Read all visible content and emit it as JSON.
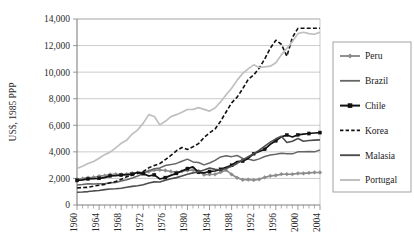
{
  "chart_data": {
    "type": "line",
    "title": "",
    "xlabel": "",
    "ylabel": "US$, 1985 PPP",
    "xlim": [
      1960,
      2004
    ],
    "ylim": [
      0,
      14000
    ],
    "ytick_labels": [
      "0",
      "2,000",
      "4,000",
      "6,000",
      "8,000",
      "10,000",
      "12,000",
      "14,000"
    ],
    "ytick_values": [
      0,
      2000,
      4000,
      6000,
      8000,
      10000,
      12000,
      14000
    ],
    "xtick_labels": [
      "1960",
      "1964",
      "1968",
      "1972",
      "1976",
      "1980",
      "1984",
      "1988",
      "1992",
      "1996",
      "2000",
      "2004"
    ],
    "xtick_values": [
      1960,
      1964,
      1968,
      1972,
      1976,
      1980,
      1984,
      1988,
      1992,
      1996,
      2000,
      2004
    ],
    "grid": true,
    "minor_xticks": true,
    "legend_position": "right",
    "x": [
      1960,
      1961,
      1962,
      1963,
      1964,
      1965,
      1966,
      1967,
      1968,
      1969,
      1970,
      1971,
      1972,
      1973,
      1974,
      1975,
      1976,
      1977,
      1978,
      1979,
      1980,
      1981,
      1982,
      1983,
      1984,
      1985,
      1986,
      1987,
      1988,
      1989,
      1990,
      1991,
      1992,
      1993,
      1994,
      1995,
      1996,
      1997,
      1998,
      1999,
      2000,
      2001,
      2002,
      2003,
      2004
    ],
    "series": [
      {
        "name": "Peru",
        "color": "#8c8c8c",
        "style": "solid-marker",
        "marker": "diamond",
        "width": 1.6,
        "values": [
          1950,
          1990,
          2060,
          2090,
          2170,
          2210,
          2300,
          2320,
          2300,
          2330,
          2400,
          2430,
          2450,
          2520,
          2620,
          2640,
          2600,
          2520,
          2460,
          2540,
          2600,
          2640,
          2560,
          2280,
          2300,
          2310,
          2470,
          2620,
          2300,
          2050,
          1900,
          1910,
          1880,
          1930,
          2080,
          2190,
          2230,
          2320,
          2320,
          2320,
          2380,
          2380,
          2420,
          2450,
          2450
        ]
      },
      {
        "name": "Brazil",
        "color": "#666666",
        "style": "solid",
        "marker": "none",
        "width": 1.5,
        "values": [
          1500,
          1540,
          1600,
          1580,
          1600,
          1600,
          1670,
          1700,
          1800,
          1900,
          2030,
          2180,
          2370,
          2590,
          2730,
          2790,
          2970,
          3040,
          3130,
          3290,
          3450,
          3240,
          3200,
          3020,
          3160,
          3360,
          3620,
          3700,
          3640,
          3730,
          3500,
          3460,
          3350,
          3470,
          3650,
          3770,
          3820,
          3890,
          3860,
          3850,
          4000,
          4000,
          4030,
          4000,
          4150
        ]
      },
      {
        "name": "Chile",
        "color": "#111111",
        "style": "solid-marker",
        "marker": "square",
        "width": 1.7,
        "values": [
          1850,
          1890,
          1960,
          1980,
          2010,
          2060,
          2190,
          2210,
          2250,
          2290,
          2310,
          2460,
          2360,
          2180,
          2270,
          1960,
          2060,
          2230,
          2380,
          2560,
          2740,
          2870,
          2460,
          2420,
          2520,
          2560,
          2680,
          2830,
          2990,
          3270,
          3300,
          3510,
          3860,
          4030,
          4200,
          4570,
          4830,
          5130,
          5270,
          5120,
          5280,
          5340,
          5380,
          5420,
          5450
        ]
      },
      {
        "name": "Korea",
        "color": "#111111",
        "style": "dashed",
        "marker": "none",
        "width": 1.6,
        "values": [
          1280,
          1320,
          1330,
          1420,
          1490,
          1550,
          1680,
          1770,
          1930,
          2130,
          2250,
          2400,
          2510,
          2800,
          2980,
          3120,
          3420,
          3730,
          4080,
          4330,
          4180,
          4380,
          4620,
          5080,
          5430,
          5720,
          6310,
          7000,
          7690,
          8120,
          8750,
          9450,
          9790,
          10300,
          11000,
          11800,
          12400,
          12100,
          11200,
          12600,
          13300,
          13300,
          13300,
          13300,
          13300
        ]
      },
      {
        "name": "Malasia",
        "color": "#4d4d4d",
        "style": "solid",
        "marker": "none",
        "width": 1.6,
        "values": [
          960,
          980,
          1010,
          1060,
          1090,
          1160,
          1200,
          1220,
          1260,
          1330,
          1400,
          1450,
          1530,
          1660,
          1740,
          1730,
          1870,
          1970,
          2060,
          2190,
          2320,
          2420,
          2510,
          2630,
          2780,
          2680,
          2630,
          2740,
          2920,
          3130,
          3390,
          3630,
          3860,
          4130,
          4430,
          4730,
          4980,
          5170,
          4700,
          4800,
          5000,
          4800,
          4850,
          4880,
          4900
        ]
      },
      {
        "name": "Portugal",
        "color": "#bfbfbf",
        "style": "solid",
        "marker": "none",
        "width": 1.7,
        "values": [
          2750,
          2920,
          3120,
          3280,
          3520,
          3790,
          3980,
          4300,
          4640,
          4880,
          5340,
          5660,
          6160,
          6800,
          6660,
          6030,
          6300,
          6650,
          6800,
          6980,
          7190,
          7200,
          7330,
          7200,
          7070,
          7300,
          7760,
          8300,
          8790,
          9400,
          9900,
          10250,
          10550,
          10350,
          10400,
          10450,
          10700,
          11300,
          11800,
          12300,
          12900,
          13000,
          12900,
          12850,
          13000
        ]
      }
    ]
  },
  "legend": {
    "items": [
      {
        "label": "Peru"
      },
      {
        "label": "Brazil"
      },
      {
        "label": "Chile"
      },
      {
        "label": "Korea"
      },
      {
        "label": "Malasia"
      },
      {
        "label": "Portugal"
      }
    ]
  }
}
